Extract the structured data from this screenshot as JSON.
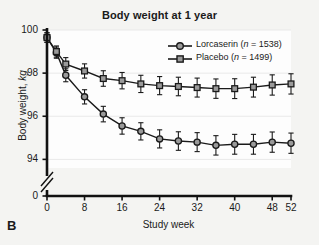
{
  "panel": {
    "label": "B"
  },
  "chart_data": {
    "type": "line",
    "title": "Body weight at 1 year",
    "xlabel": "Study week",
    "ylabel_plain": "Body weight, kg",
    "ylabel_main": "Body weight, ",
    "ylabel_italic": "kg",
    "x": [
      0,
      2,
      4,
      8,
      12,
      16,
      20,
      24,
      28,
      32,
      36,
      40,
      44,
      48,
      52
    ],
    "xticks": [
      0,
      8,
      16,
      24,
      32,
      40,
      48,
      52
    ],
    "xtick_labels": [
      "0",
      "8",
      "16",
      "24",
      "32",
      "40",
      "48",
      "52"
    ],
    "yticks": [
      94,
      96,
      98,
      100
    ],
    "ytick_labels": [
      "94",
      "96",
      "98",
      "100"
    ],
    "y_break_label": "0",
    "xlim": [
      0,
      52
    ],
    "ylim": [
      93.6,
      100.0
    ],
    "grid": "horizontal-light",
    "axis_break": true,
    "legend_position": "top-right",
    "series": [
      {
        "name": "Lorcaserin",
        "n": 1538,
        "legend_label": "Lorcaserin (n = 1538)",
        "legend_name": "Lorcaserin ",
        "legend_n_italic": "n",
        "legend_n_rest": " = 1538)",
        "marker": "circle",
        "values": [
          99.65,
          98.95,
          97.9,
          96.9,
          96.1,
          95.55,
          95.3,
          94.95,
          94.85,
          94.8,
          94.65,
          94.7,
          94.7,
          94.8,
          94.75
        ],
        "err": [
          0.22,
          0.26,
          0.3,
          0.33,
          0.36,
          0.38,
          0.4,
          0.42,
          0.43,
          0.44,
          0.45,
          0.46,
          0.46,
          0.47,
          0.47
        ]
      },
      {
        "name": "Placebo",
        "n": 1499,
        "legend_label": "Placebo (n = 1499)",
        "legend_name": "Placebo (",
        "legend_n_italic": "n",
        "legend_n_rest": " = 1499)",
        "marker": "square",
        "values": [
          99.65,
          99.0,
          98.42,
          98.1,
          97.75,
          97.65,
          97.5,
          97.42,
          97.38,
          97.33,
          97.28,
          97.28,
          97.35,
          97.45,
          97.5
        ],
        "err": [
          0.22,
          0.26,
          0.3,
          0.33,
          0.36,
          0.38,
          0.4,
          0.42,
          0.43,
          0.44,
          0.45,
          0.46,
          0.46,
          0.47,
          0.47
        ]
      }
    ],
    "colors": {
      "line": "#1a1a1a",
      "marker_fill": "#9a9a9a",
      "plot_background": "#fdfdfd",
      "page_background": "#f4f4f2"
    }
  }
}
